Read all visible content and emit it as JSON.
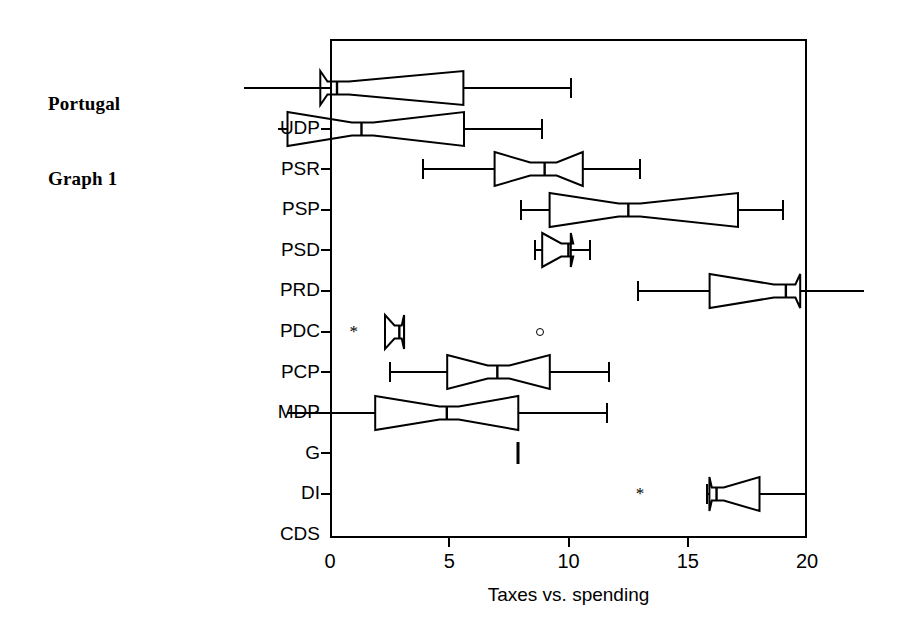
{
  "caption": {
    "line1": "Portugal",
    "line2": "Graph 1"
  },
  "chart_data": {
    "type": "box",
    "title": "Portugal Graph 1",
    "xlabel": "Taxes vs. spending",
    "ylabel": "",
    "xlim": [
      0,
      20
    ],
    "xticks": [
      0,
      5,
      10,
      15,
      20
    ],
    "xticklabels": [
      "0",
      "5",
      "10",
      "15",
      "20"
    ],
    "grid": false,
    "legend": null,
    "orientation": "horizontal",
    "notched": true,
    "categories": [
      "UDP",
      "PSR",
      "PSP",
      "PSD",
      "PRD",
      "PDC",
      "PCP",
      "MDP",
      "G",
      "DI",
      "CDS"
    ],
    "boxes": [
      {
        "category": "UDP",
        "whisker_low": -3.6,
        "q1": -0.4,
        "median": 0.3,
        "q3": 5.6,
        "whisker_high": 10.1,
        "notch_low": -0.1,
        "notch_high": 0.8,
        "outliers": []
      },
      {
        "category": "PSR",
        "whisker_low": -2.2,
        "q1": -1.8,
        "median": 1.3,
        "q3": 5.6,
        "whisker_high": 8.9,
        "notch_low": 0.9,
        "notch_high": 1.8,
        "outliers": []
      },
      {
        "category": "PSP",
        "whisker_low": 3.9,
        "q1": 6.9,
        "median": 9.0,
        "q3": 10.6,
        "whisker_high": 13.0,
        "notch_low": 8.4,
        "notch_high": 9.5,
        "outliers": []
      },
      {
        "category": "PSD",
        "whisker_low": 8.0,
        "q1": 9.2,
        "median": 12.5,
        "q3": 17.1,
        "whisker_high": 19.0,
        "notch_low": 12.1,
        "notch_high": 13.0,
        "outliers": []
      },
      {
        "category": "PRD",
        "whisker_low": 8.6,
        "q1": 8.9,
        "median": 10.0,
        "q3": 10.1,
        "whisker_high": 10.9,
        "notch_low": 9.7,
        "notch_high": 10.2,
        "outliers": []
      },
      {
        "category": "PDC",
        "whisker_low": 12.9,
        "q1": 15.9,
        "median": 19.1,
        "q3": 19.7,
        "whisker_high": 22.4,
        "notch_low": 18.6,
        "notch_high": 19.5,
        "outliers": []
      },
      {
        "category": "PCP",
        "whisker_low": 2.3,
        "q1": 2.3,
        "median": 2.9,
        "q3": 3.1,
        "whisker_high": 3.1,
        "notch_low": 2.7,
        "notch_high": 3.0,
        "outliers": [
          {
            "value": 1.0,
            "marker": "*"
          },
          {
            "value": 8.8,
            "marker": "o"
          }
        ]
      },
      {
        "category": "MDP",
        "whisker_low": 2.5,
        "q1": 4.9,
        "median": 7.0,
        "q3": 9.2,
        "whisker_high": 11.7,
        "notch_low": 6.6,
        "notch_high": 7.5,
        "outliers": []
      },
      {
        "category": "G",
        "whisker_low": -1.8,
        "q1": 1.9,
        "median": 4.9,
        "q3": 7.9,
        "whisker_high": 11.6,
        "notch_low": 4.6,
        "notch_high": 5.4,
        "outliers": []
      },
      {
        "category": "DI",
        "whisker_low": 7.9,
        "q1": 7.9,
        "median": 7.9,
        "q3": 7.9,
        "whisker_high": 7.9,
        "notch_low": 7.9,
        "notch_high": 7.9,
        "outliers": []
      },
      {
        "category": "CDS",
        "whisker_low": 15.8,
        "q1": 15.9,
        "median": 16.2,
        "q3": 18.0,
        "whisker_high": 20.0,
        "notch_low": 16.0,
        "notch_high": 16.5,
        "outliers": [
          {
            "value": 13.0,
            "marker": "*"
          }
        ]
      }
    ]
  },
  "colors": {
    "ink": "#000000",
    "background": "#ffffff"
  }
}
